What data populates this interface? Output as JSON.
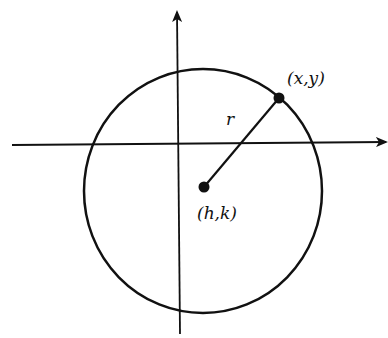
{
  "diagram": {
    "type": "circle-with-center-and-radius",
    "labels": {
      "point": "(x,y)",
      "center": "(h,k)",
      "radius": "r"
    },
    "colors": {
      "stroke": "#111111",
      "background": "#ffffff"
    }
  }
}
